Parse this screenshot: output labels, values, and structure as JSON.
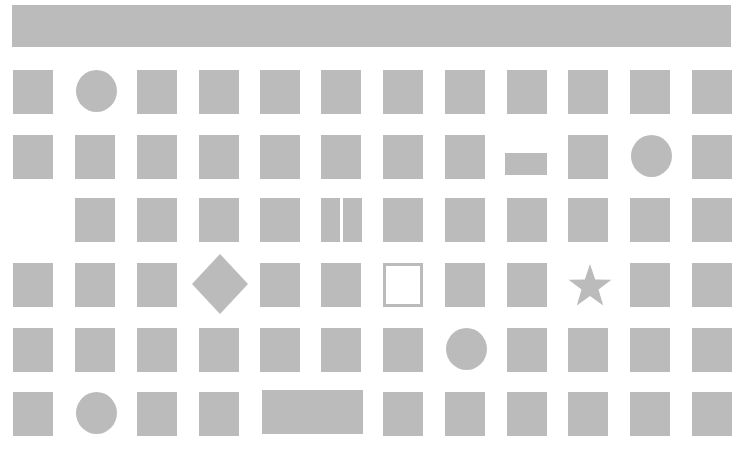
{
  "banner": {
    "color": "#bbbbbb"
  },
  "palette": {
    "fill": "#bbbbbb",
    "background": "#ffffff"
  },
  "grid": {
    "columns_x": [
      13,
      75,
      137,
      199,
      260,
      321,
      383,
      445,
      507,
      568,
      630,
      692
    ],
    "rows_y": [
      70,
      135,
      198,
      263,
      328,
      392
    ],
    "cell_w": 40,
    "cell_h": 44
  },
  "shapes": [
    {
      "row": 0,
      "col": 0,
      "type": "square"
    },
    {
      "row": 0,
      "col": 1,
      "type": "circle"
    },
    {
      "row": 0,
      "col": 2,
      "type": "square"
    },
    {
      "row": 0,
      "col": 3,
      "type": "square"
    },
    {
      "row": 0,
      "col": 4,
      "type": "square"
    },
    {
      "row": 0,
      "col": 5,
      "type": "square"
    },
    {
      "row": 0,
      "col": 6,
      "type": "square"
    },
    {
      "row": 0,
      "col": 7,
      "type": "square"
    },
    {
      "row": 0,
      "col": 8,
      "type": "square"
    },
    {
      "row": 0,
      "col": 9,
      "type": "square"
    },
    {
      "row": 0,
      "col": 10,
      "type": "square"
    },
    {
      "row": 0,
      "col": 11,
      "type": "square"
    },
    {
      "row": 1,
      "col": 0,
      "type": "square"
    },
    {
      "row": 1,
      "col": 1,
      "type": "square"
    },
    {
      "row": 1,
      "col": 2,
      "type": "square"
    },
    {
      "row": 1,
      "col": 3,
      "type": "square"
    },
    {
      "row": 1,
      "col": 4,
      "type": "square"
    },
    {
      "row": 1,
      "col": 5,
      "type": "square"
    },
    {
      "row": 1,
      "col": 6,
      "type": "square"
    },
    {
      "row": 1,
      "col": 7,
      "type": "square"
    },
    {
      "row": 1,
      "col": 8,
      "type": "short-bar"
    },
    {
      "row": 1,
      "col": 9,
      "type": "square"
    },
    {
      "row": 1,
      "col": 10,
      "type": "circle"
    },
    {
      "row": 1,
      "col": 11,
      "type": "square"
    },
    {
      "row": 2,
      "col": 1,
      "type": "square"
    },
    {
      "row": 2,
      "col": 2,
      "type": "square"
    },
    {
      "row": 2,
      "col": 3,
      "type": "square"
    },
    {
      "row": 2,
      "col": 4,
      "type": "square"
    },
    {
      "row": 2,
      "col": 5,
      "type": "split"
    },
    {
      "row": 2,
      "col": 6,
      "type": "square"
    },
    {
      "row": 2,
      "col": 7,
      "type": "square"
    },
    {
      "row": 2,
      "col": 8,
      "type": "square"
    },
    {
      "row": 2,
      "col": 9,
      "type": "square"
    },
    {
      "row": 2,
      "col": 10,
      "type": "square"
    },
    {
      "row": 2,
      "col": 11,
      "type": "square"
    },
    {
      "row": 3,
      "col": 0,
      "type": "square"
    },
    {
      "row": 3,
      "col": 1,
      "type": "square"
    },
    {
      "row": 3,
      "col": 2,
      "type": "square"
    },
    {
      "row": 3,
      "col": 3,
      "type": "diamond"
    },
    {
      "row": 3,
      "col": 4,
      "type": "square"
    },
    {
      "row": 3,
      "col": 5,
      "type": "square"
    },
    {
      "row": 3,
      "col": 6,
      "type": "outline"
    },
    {
      "row": 3,
      "col": 7,
      "type": "square"
    },
    {
      "row": 3,
      "col": 8,
      "type": "square"
    },
    {
      "row": 3,
      "col": 9,
      "type": "star"
    },
    {
      "row": 3,
      "col": 10,
      "type": "square"
    },
    {
      "row": 3,
      "col": 11,
      "type": "square"
    },
    {
      "row": 4,
      "col": 0,
      "type": "square"
    },
    {
      "row": 4,
      "col": 1,
      "type": "square"
    },
    {
      "row": 4,
      "col": 2,
      "type": "square"
    },
    {
      "row": 4,
      "col": 3,
      "type": "square"
    },
    {
      "row": 4,
      "col": 4,
      "type": "square"
    },
    {
      "row": 4,
      "col": 5,
      "type": "square"
    },
    {
      "row": 4,
      "col": 6,
      "type": "square"
    },
    {
      "row": 4,
      "col": 7,
      "type": "circle"
    },
    {
      "row": 4,
      "col": 8,
      "type": "square"
    },
    {
      "row": 4,
      "col": 9,
      "type": "square"
    },
    {
      "row": 4,
      "col": 10,
      "type": "square"
    },
    {
      "row": 4,
      "col": 11,
      "type": "square"
    },
    {
      "row": 5,
      "col": 0,
      "type": "square"
    },
    {
      "row": 5,
      "col": 1,
      "type": "circle"
    },
    {
      "row": 5,
      "col": 2,
      "type": "square"
    },
    {
      "row": 5,
      "col": 3,
      "type": "square"
    },
    {
      "row": 5,
      "col": 4,
      "type": "wide"
    },
    {
      "row": 5,
      "col": 6,
      "type": "square"
    },
    {
      "row": 5,
      "col": 7,
      "type": "square"
    },
    {
      "row": 5,
      "col": 8,
      "type": "square"
    },
    {
      "row": 5,
      "col": 9,
      "type": "square"
    },
    {
      "row": 5,
      "col": 10,
      "type": "square"
    },
    {
      "row": 5,
      "col": 11,
      "type": "square"
    }
  ]
}
